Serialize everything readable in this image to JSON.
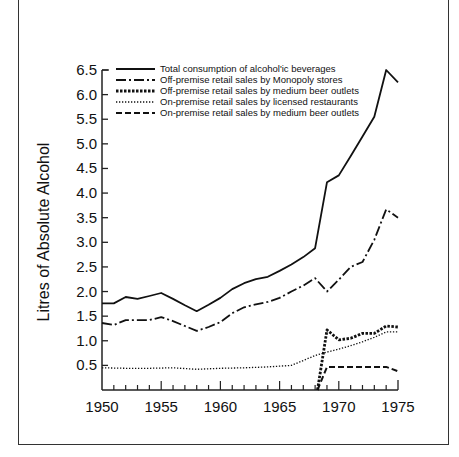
{
  "chart_data": {
    "type": "line",
    "title": "",
    "xlabel": "",
    "ylabel": "Litres of Absolute Alcohol",
    "xlim": [
      1950,
      1975
    ],
    "ylim": [
      0,
      6.5
    ],
    "x_ticks": [
      1950,
      1955,
      1960,
      1965,
      1970,
      1975
    ],
    "x_tick_labels": [
      "1950",
      "1955",
      "1960",
      "1965",
      "1970",
      "1975"
    ],
    "y_ticks": [
      0.5,
      1.0,
      1.5,
      2.0,
      2.5,
      3.0,
      3.5,
      4.0,
      4.5,
      5.0,
      5.5,
      6.0,
      6.5
    ],
    "y_tick_labels": [
      "0.5",
      "1.0",
      "1.5",
      "2.0",
      "2.5",
      "3.0",
      "3.5",
      "4.0",
      "4.5",
      "5.0",
      "5.5",
      "6.0",
      "6.5"
    ],
    "grid": false,
    "legend_position": "top-inside",
    "series": [
      {
        "name": "Total consumption of alcoholic beverages",
        "style": "solid",
        "x": [
          1950,
          1951,
          1952,
          1953,
          1954,
          1955,
          1956,
          1957,
          1958,
          1959,
          1960,
          1961,
          1962,
          1963,
          1964,
          1965,
          1966,
          1967,
          1968,
          1969,
          1970,
          1971,
          1972,
          1973,
          1974,
          1975
        ],
        "values": [
          1.76,
          1.76,
          1.89,
          1.85,
          1.91,
          1.97,
          1.85,
          1.72,
          1.6,
          1.73,
          1.87,
          2.05,
          2.17,
          2.25,
          2.3,
          2.42,
          2.55,
          2.7,
          2.88,
          4.22,
          4.36,
          4.75,
          5.15,
          5.55,
          6.5,
          6.25
        ]
      },
      {
        "name": "Off-premise retail sales by Monopoly stores",
        "style": "dashdot",
        "x": [
          1950,
          1951,
          1952,
          1953,
          1954,
          1955,
          1956,
          1957,
          1958,
          1959,
          1960,
          1961,
          1962,
          1963,
          1964,
          1965,
          1966,
          1967,
          1968,
          1969,
          1970,
          1971,
          1972,
          1973,
          1974,
          1975
        ],
        "values": [
          1.36,
          1.32,
          1.42,
          1.42,
          1.42,
          1.48,
          1.4,
          1.3,
          1.2,
          1.28,
          1.38,
          1.56,
          1.68,
          1.74,
          1.79,
          1.87,
          2.0,
          2.12,
          2.27,
          2.0,
          2.24,
          2.5,
          2.6,
          3.05,
          3.67,
          3.5
        ]
      },
      {
        "name": "Off-premise retail sales by medium beer outlets",
        "style": "thick-dotted",
        "x": [
          1968.2,
          1969,
          1970,
          1971,
          1972,
          1973,
          1974,
          1975
        ],
        "values": [
          0.0,
          1.22,
          1.02,
          1.05,
          1.15,
          1.15,
          1.3,
          1.28
        ]
      },
      {
        "name": "On-premise retail sales by licensed restaurants",
        "style": "dotted",
        "x": [
          1950,
          1952,
          1954,
          1956,
          1958,
          1960,
          1962,
          1964,
          1966,
          1967,
          1968,
          1969,
          1970,
          1971,
          1972,
          1973,
          1974,
          1975
        ],
        "values": [
          0.45,
          0.44,
          0.44,
          0.45,
          0.42,
          0.44,
          0.45,
          0.47,
          0.5,
          0.6,
          0.7,
          0.77,
          0.83,
          0.9,
          0.98,
          1.07,
          1.18,
          1.18
        ]
      },
      {
        "name": "On-premise retail sales by medium beer outlets",
        "style": "dashed",
        "x": [
          1968.2,
          1969,
          1970,
          1971,
          1972,
          1973,
          1974,
          1975
        ],
        "values": [
          0.0,
          0.47,
          0.47,
          0.47,
          0.47,
          0.47,
          0.47,
          0.38
        ]
      }
    ]
  },
  "legend": {
    "items": [
      {
        "label": "Total consumption of alcohol'ic beverages"
      },
      {
        "label": "Off-premise retail sales by Monopoly stores"
      },
      {
        "label": "Off-premise retail sales by medium beer outlets"
      },
      {
        "label": "On-premise retail sales by licensed restaurants"
      },
      {
        "label": "On-premise retail sales by medium beer outlets"
      }
    ]
  }
}
